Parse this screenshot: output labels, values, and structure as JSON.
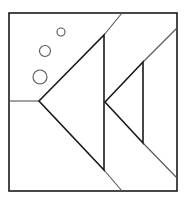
{
  "figure": {
    "stroke_color": "#1a1a1a",
    "thin_stroke_color": "#555555",
    "background": "#ffffff",
    "frame": {
      "x": 9,
      "y": 13,
      "w": 168,
      "h": 178
    },
    "big_triangle": {
      "points": "39,101 104,35 104,170"
    },
    "small_triangle": {
      "points": "105,102 143,62 143,143"
    },
    "lines": [
      {
        "name": "left-horizontal-line",
        "x1": 9,
        "y1": 101,
        "x2": 39,
        "y2": 101
      },
      {
        "name": "upper-big-extension-line",
        "x1": 104,
        "y1": 35,
        "x2": 122,
        "y2": 13
      },
      {
        "name": "lower-big-extension-line",
        "x1": 104,
        "y1": 170,
        "x2": 122,
        "y2": 191
      },
      {
        "name": "upper-small-extension-line",
        "x1": 143,
        "y1": 62,
        "x2": 177,
        "y2": 28
      },
      {
        "name": "lower-small-extension-line",
        "x1": 143,
        "y1": 143,
        "x2": 177,
        "y2": 178
      }
    ],
    "bubbles": [
      {
        "name": "bubble-small",
        "cx": 61,
        "cy": 32,
        "r": 4
      },
      {
        "name": "bubble-medium",
        "cx": 45,
        "cy": 51,
        "r": 5.5
      },
      {
        "name": "bubble-large",
        "cx": 40,
        "cy": 77,
        "r": 7
      }
    ]
  }
}
